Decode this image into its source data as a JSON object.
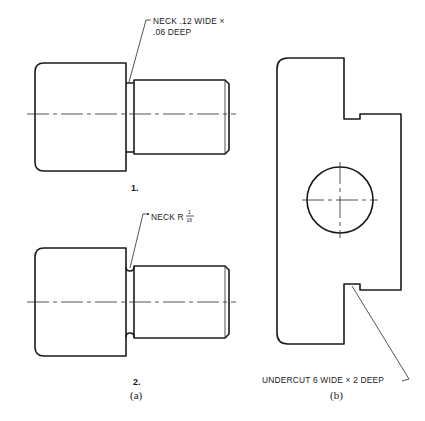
{
  "figure": {
    "part_a": {
      "caption": "(a)",
      "example_1": {
        "label": "1.",
        "note_line1": "NECK .12 WIDE ×",
        "note_line2": ".06 DEEP"
      },
      "example_2": {
        "label": "2.",
        "note_prefix": "NECK R",
        "fraction_num": "1",
        "fraction_den": "16"
      }
    },
    "part_b": {
      "caption": "(b)",
      "note": "UNDERCUT 6 WIDE × 2 DEEP"
    }
  },
  "colors": {
    "line": "#1a1a1a",
    "background": "#ffffff"
  }
}
